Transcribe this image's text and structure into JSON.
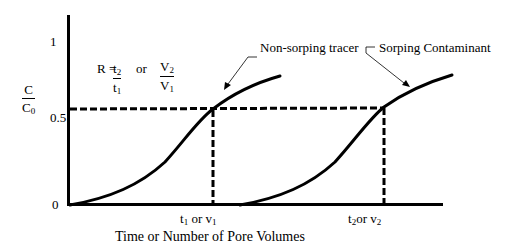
{
  "diagram": {
    "title": "",
    "y_axis": {
      "label_numerator": "C",
      "label_denominator": "C",
      "label_denominator_sub": "0",
      "ticks": [
        "1",
        "0.5",
        "0"
      ]
    },
    "x_axis": {
      "label": "Time or Number of Pore Volumes",
      "tick_t1": {
        "t": "t",
        "t_sub": "1",
        "or": " or ",
        "v": "v",
        "v_sub": "1"
      },
      "tick_t2": {
        "t": "t",
        "t_sub": "2",
        "or": "or ",
        "v": "v",
        "v_sub": "2"
      }
    },
    "equation": {
      "lhs": "R = ",
      "frac1_num": "t",
      "frac1_num_sub": "2",
      "frac1_den": "t",
      "frac1_den_sub": "1",
      "or": "or",
      "frac2_num": "V",
      "frac2_num_sub": "2",
      "frac2_den": "V",
      "frac2_den_sub": "1"
    },
    "annotations": {
      "tracer": "Non-sorping tracer",
      "contaminant": "Sorping Contaminant"
    },
    "curves": [
      {
        "name": "Non-sorping tracer",
        "half_point_x": "t1 or v1"
      },
      {
        "name": "Sorping Contaminant",
        "half_point_x": "t2 or v2"
      }
    ],
    "reference_level": 0.5,
    "colors": {
      "line": "#000000",
      "background": "#ffffff"
    }
  }
}
